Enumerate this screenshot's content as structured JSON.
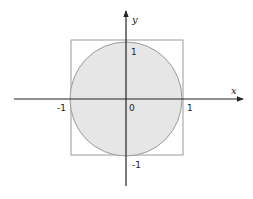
{
  "diagram": {
    "axes": {
      "x_label": "x",
      "y_label": "y"
    },
    "tick_labels": {
      "x_neg": "-1",
      "origin": "0",
      "x_pos": "1",
      "y_pos": "1",
      "y_neg": "-1"
    },
    "shapes": {
      "circle": {
        "center": [
          0,
          0
        ],
        "radius": 1,
        "fill": "#e6e6e6",
        "stroke": "#999999"
      },
      "square": {
        "x_range": [
          -1,
          1
        ],
        "y_range": [
          -1,
          1
        ],
        "fill": "none",
        "stroke": "#999999"
      }
    },
    "colors": {
      "axis": "#222222",
      "circle_fill": "#e6e6e6",
      "outline": "#999999"
    }
  }
}
